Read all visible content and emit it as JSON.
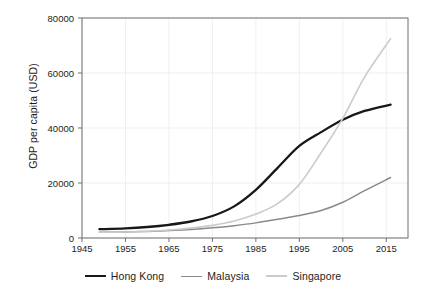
{
  "chart_data": {
    "type": "line",
    "title": "",
    "subtitle": "",
    "xlabel": "",
    "ylabel": "GDP per capita (USD)",
    "xlim": [
      1945,
      2020
    ],
    "ylim": [
      0,
      80000
    ],
    "grid": true,
    "legend_position": "bottom",
    "x_ticks": [
      1945,
      1955,
      1965,
      1975,
      1985,
      1995,
      2005,
      2015
    ],
    "x_tick_labels": [
      "1945",
      "1955",
      "1965",
      "1975",
      "1985",
      "1995",
      "2005",
      "2015"
    ],
    "y_ticks": [
      0,
      20000,
      40000,
      60000,
      80000
    ],
    "y_tick_labels": [
      "0",
      "20000",
      "40000",
      "60000",
      "80000"
    ],
    "x": [
      1949,
      1955,
      1960,
      1965,
      1970,
      1975,
      1980,
      1985,
      1990,
      1995,
      2000,
      2005,
      2010,
      2016
    ],
    "series": [
      {
        "name": "Hong Kong",
        "color": "#17181a",
        "width": 2.3,
        "values": [
          3200,
          3500,
          4000,
          4800,
          6000,
          8000,
          11500,
          17500,
          25500,
          33500,
          38500,
          43000,
          46200,
          48500
        ]
      },
      {
        "name": "Malaysia",
        "color": "#878a8d",
        "width": 1.5,
        "values": [
          2100,
          2200,
          2400,
          2700,
          3100,
          3700,
          4500,
          5500,
          6800,
          8200,
          10000,
          13000,
          17200,
          22000
        ]
      },
      {
        "name": "Singapore",
        "color": "#c9cbcd",
        "width": 1.6,
        "values": [
          2100,
          2200,
          2450,
          2900,
          3600,
          4600,
          6200,
          8700,
          12500,
          19500,
          31000,
          43500,
          58500,
          72500
        ]
      }
    ],
    "annotations": []
  },
  "legend": {
    "items": [
      {
        "label": "Hong Kong"
      },
      {
        "label": "Malaysia"
      },
      {
        "label": "Singapore"
      }
    ]
  },
  "axes": {
    "frame_color": "#6d6f72",
    "grid_color": "#efeff0",
    "text_color": "#1d1d1d"
  }
}
